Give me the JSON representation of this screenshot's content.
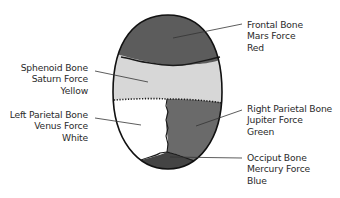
{
  "diagram": {
    "regions": [
      {
        "id": "frontal",
        "bone": "Frontal Bone",
        "force": "Mars Force",
        "color_name": "Red",
        "fill": "#5c5c5c"
      },
      {
        "id": "sphenoid",
        "bone": "Sphenoid Bone",
        "force": "Saturn Force",
        "color_name": "Yellow",
        "fill": "#d7d7d7"
      },
      {
        "id": "left-parietal",
        "bone": "Left Parietal Bone",
        "force": "Venus Force",
        "color_name": "White",
        "fill": "#ffffff"
      },
      {
        "id": "right-parietal",
        "bone": "Right Parietal Bone",
        "force": "Jupiter Force",
        "color_name": "Green",
        "fill": "#6a6a6a"
      },
      {
        "id": "occiput",
        "bone": "Occiput Bone",
        "force": "Mercury Force",
        "color_name": "Blue",
        "fill": "#444444"
      }
    ]
  },
  "labels": {
    "frontal": {
      "line1": "Frontal Bone",
      "line2": "Mars Force",
      "line3": "Red"
    },
    "sphenoid": {
      "line1": "Sphenoid Bone",
      "line2": "Saturn Force",
      "line3": "Yellow"
    },
    "left_parietal": {
      "line1": "Left Parietal Bone",
      "line2": "Venus Force",
      "line3": "White"
    },
    "right_parietal": {
      "line1": "Right Parietal Bone",
      "line2": "Jupiter Force",
      "line3": "Green"
    },
    "occiput": {
      "line1": "Occiput Bone",
      "line2": "Mercury Force",
      "line3": "Blue"
    }
  }
}
